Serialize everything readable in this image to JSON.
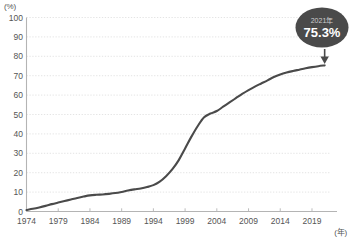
{
  "chart_data": {
    "type": "line",
    "title": "",
    "subtitle": "",
    "xlabel": "(年)",
    "ylabel": "(%)",
    "xlim": [
      1974,
      2022
    ],
    "ylim": [
      0,
      100
    ],
    "grid": true,
    "legend": null,
    "y_ticks": [
      0,
      10,
      20,
      30,
      40,
      50,
      60,
      70,
      80,
      90,
      100
    ],
    "y_tick_labels": [
      "0",
      "10",
      "20",
      "30",
      "40",
      "50",
      "60",
      "70",
      "80",
      "90",
      "100"
    ],
    "x_ticks": [
      1974,
      1979,
      1984,
      1989,
      1994,
      1999,
      2004,
      2009,
      2014,
      2019
    ],
    "x_tick_labels": [
      "1974",
      "1979",
      "1984",
      "1989",
      "1994",
      "1999",
      "2004",
      "2009",
      "2014",
      "2019"
    ],
    "series": [
      {
        "name": "普及率",
        "color": "#4a4a4a",
        "x": [
          1974,
          1975,
          1976,
          1977,
          1978,
          1979,
          1980,
          1981,
          1982,
          1983,
          1984,
          1985,
          1986,
          1987,
          1988,
          1989,
          1990,
          1991,
          1992,
          1993,
          1994,
          1995,
          1996,
          1997,
          1998,
          1999,
          2000,
          2001,
          2002,
          2003,
          2004,
          2005,
          2006,
          2007,
          2008,
          2009,
          2010,
          2011,
          2012,
          2013,
          2014,
          2015,
          2016,
          2017,
          2018,
          2019,
          2020,
          2021
        ],
        "values": [
          0.8,
          1.4,
          2.1,
          2.9,
          3.8,
          4.6,
          5.4,
          6.2,
          7.0,
          7.7,
          8.3,
          8.6,
          8.8,
          9.1,
          9.5,
          10.1,
          10.8,
          11.4,
          11.9,
          12.6,
          13.6,
          15.4,
          18.2,
          21.8,
          26.5,
          32.5,
          38.6,
          44.1,
          48.6,
          50.5,
          51.8,
          54.0,
          56.2,
          58.4,
          60.6,
          62.6,
          64.4,
          66.0,
          67.6,
          69.3,
          70.6,
          71.6,
          72.4,
          73.1,
          73.8,
          74.4,
          74.9,
          75.3
        ]
      }
    ],
    "annotations": [
      {
        "id": "callout-2021",
        "year_label": "2021年",
        "value_label": "75.3%",
        "target_year": 2021,
        "target_value": 75.3,
        "bubble_color": "#4a4a4a",
        "year_text_color": "#cfcfcf",
        "value_text_color": "#ffffff"
      }
    ]
  },
  "axes": {
    "y_unit": "(%)",
    "x_unit": "(年)"
  }
}
